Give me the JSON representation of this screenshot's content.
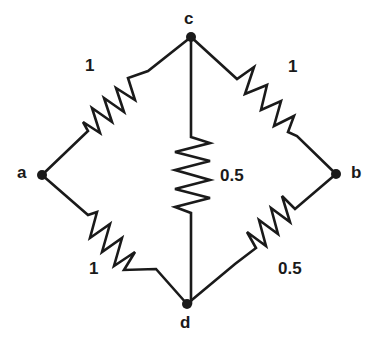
{
  "diagram": {
    "title": "",
    "type": "resistor bridge network",
    "nodes": [
      {
        "id": "a",
        "label": "a",
        "x": 42,
        "y": 175
      },
      {
        "id": "b",
        "label": "b",
        "x": 336,
        "y": 174
      },
      {
        "id": "c",
        "label": "c",
        "x": 191,
        "y": 37
      },
      {
        "id": "d",
        "label": "d",
        "x": 187,
        "y": 304
      }
    ],
    "resistors": [
      {
        "id": "r_ac",
        "from": "a",
        "to": "c",
        "label": "1"
      },
      {
        "id": "r_cb",
        "from": "c",
        "to": "b",
        "label": "1"
      },
      {
        "id": "r_cd",
        "from": "c",
        "to": "d",
        "label": "0.5"
      },
      {
        "id": "r_ad",
        "from": "a",
        "to": "d",
        "label": "1"
      },
      {
        "id": "r_bd",
        "from": "b",
        "to": "d",
        "label": "0.5"
      }
    ],
    "colors": {
      "stroke": "#1a1a1a",
      "background": "#ffffff"
    }
  }
}
